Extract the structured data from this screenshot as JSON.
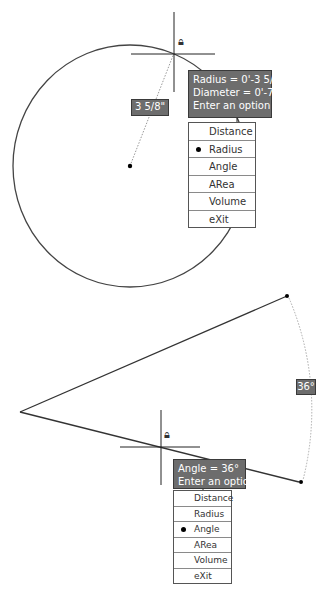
{
  "upper": {
    "tooltip": {
      "lines": [
        "Radius = 0'-3 5/8\"",
        "Diameter = 0'-7 5/16\"",
        "Enter an option"
      ]
    },
    "dimension_label": "3 5/8\"",
    "menu": {
      "items": [
        {
          "label": "Distance",
          "selected": false
        },
        {
          "label": "Radius",
          "selected": true
        },
        {
          "label": "Angle",
          "selected": false
        },
        {
          "label": "ARea",
          "selected": false
        },
        {
          "label": "Volume",
          "selected": false
        },
        {
          "label": "eXit",
          "selected": false
        }
      ]
    },
    "lock_icon": "snap-lock-icon"
  },
  "lower": {
    "tooltip": {
      "lines": [
        "Angle = 36°",
        "Enter an option"
      ]
    },
    "dimension_label": "36°",
    "menu": {
      "items": [
        {
          "label": "Distance",
          "selected": false
        },
        {
          "label": "Radius",
          "selected": false
        },
        {
          "label": "Angle",
          "selected": true
        },
        {
          "label": "ARea",
          "selected": false
        },
        {
          "label": "Volume",
          "selected": false
        },
        {
          "label": "eXit",
          "selected": false
        }
      ]
    },
    "lock_icon": "snap-lock-icon"
  },
  "colors": {
    "tooltip_bg": "#6d6d6d",
    "geometry": "#333333",
    "background": "#ffffff"
  }
}
